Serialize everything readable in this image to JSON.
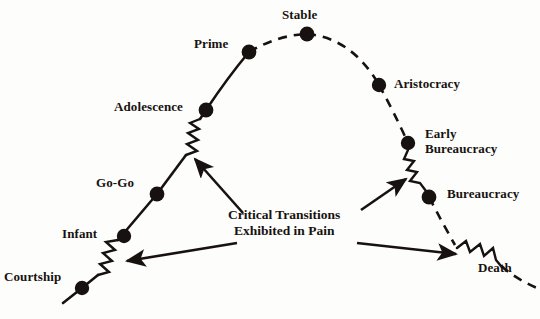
{
  "figure": {
    "type": "lifecycle-curve",
    "title": "",
    "background_color": "#fdfdfc",
    "ink_color": "#17120f"
  },
  "nodes": [
    {
      "id": "courtship",
      "label": "Courtship",
      "x": 82,
      "y": 288,
      "side": "growth",
      "label_x": 4,
      "label_y": 269
    },
    {
      "id": "infant",
      "label": "Infant",
      "x": 124,
      "y": 236,
      "side": "growth",
      "label_x": 62,
      "label_y": 226
    },
    {
      "id": "go-go",
      "label": "Go-Go",
      "x": 157,
      "y": 194,
      "side": "growth",
      "label_x": 96,
      "label_y": 175
    },
    {
      "id": "adolescence",
      "label": "Adolescence",
      "x": 206,
      "y": 110,
      "side": "growth",
      "label_x": 114,
      "label_y": 99
    },
    {
      "id": "prime",
      "label": "Prime",
      "x": 249,
      "y": 52,
      "side": "growth",
      "label_x": 194,
      "label_y": 36
    },
    {
      "id": "stable",
      "label": "Stable",
      "x": 307,
      "y": 34,
      "side": "peak",
      "label_x": 282,
      "label_y": 7
    },
    {
      "id": "aristocracy",
      "label": "Aristocracy",
      "x": 379,
      "y": 85,
      "side": "aging",
      "label_x": 394,
      "label_y": 76
    },
    {
      "id": "early-bureaucracy",
      "label": "Early\nBureaucracy",
      "x": 408,
      "y": 143,
      "side": "aging",
      "label_x": 425,
      "label_y": 126
    },
    {
      "id": "bureaucracy",
      "label": "Bureaucracy",
      "x": 429,
      "y": 197,
      "side": "aging",
      "label_x": 447,
      "label_y": 186
    },
    {
      "id": "death",
      "label": "Death",
      "x": 0,
      "y": 0,
      "side": "aging",
      "label_x": 478,
      "label_y": 260,
      "has_dot": false
    }
  ],
  "node_labels": {
    "courtship": "Courtship",
    "infant": "Infant",
    "go_go": "Go-Go",
    "adolescence": "Adolescence",
    "prime": "Prime",
    "stable": "Stable",
    "aristocracy": "Aristocracy",
    "early_bureaucracy_line1": "Early",
    "early_bureaucracy_line2": "Bureaucracy",
    "bureaucracy": "Bureaucracy",
    "death": "Death"
  },
  "annotation": {
    "line1": "Critical Transitions",
    "line2": "Exhibited in Pain",
    "x": 228,
    "y": 207
  },
  "transitions": [
    {
      "id": "courtship-to-infant",
      "between": [
        "courtship",
        "infant"
      ]
    },
    {
      "id": "adolescence-transition",
      "between": [
        "go-go",
        "adolescence"
      ]
    },
    {
      "id": "early-bureaucracy-transition",
      "between": [
        "early-bureaucracy",
        "bureaucracy"
      ]
    },
    {
      "id": "death-transition",
      "between": [
        "bureaucracy",
        "death"
      ]
    }
  ],
  "arrows": [
    {
      "id": "arrow-to-adolescence-zigzag",
      "from": [
        243,
        213
      ],
      "to": [
        193,
        157
      ]
    },
    {
      "id": "arrow-to-courtship-zigzag",
      "from": [
        237,
        243
      ],
      "to": [
        124,
        262
      ]
    },
    {
      "id": "arrow-to-bureaucracy-zigzag",
      "from": [
        361,
        210
      ],
      "to": [
        408,
        178
      ]
    },
    {
      "id": "arrow-to-death-zigzag",
      "from": [
        357,
        243
      ],
      "to": [
        459,
        255
      ]
    }
  ],
  "style": {
    "growth_line": "solid",
    "aging_line": "dashed",
    "dot_radius": 7,
    "stroke_width": 2.6,
    "dash_pattern": "9 7"
  }
}
